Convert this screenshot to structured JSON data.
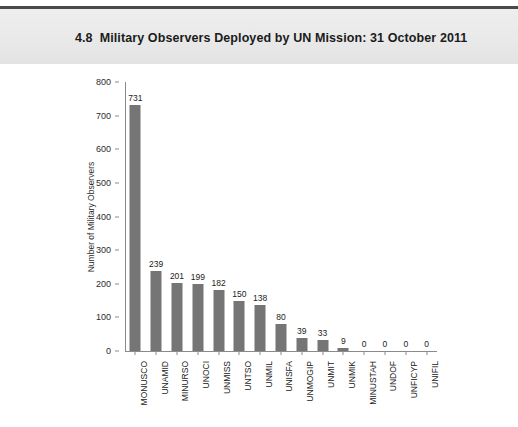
{
  "header": {
    "figure_number": "4.8",
    "title": "Military Observers Deployed by UN Mission: 31 October 2011"
  },
  "chart_data": {
    "type": "bar",
    "xlabel": "",
    "ylabel": "Number of Military Observers",
    "ylim": [
      0,
      800
    ],
    "yticks": [
      0,
      100,
      200,
      300,
      400,
      500,
      600,
      700,
      800
    ],
    "grid": false,
    "legend": null,
    "bar_color": "#757575",
    "categories": [
      "MONUSCO",
      "UNAMID",
      "MINURSO",
      "UNOCI",
      "UNMISS",
      "UNTSO",
      "UNMIL",
      "UNISFA",
      "UNMOGIP",
      "UNMIT",
      "UNMIK",
      "MINUSTAH",
      "UNDOF",
      "UNFICYP",
      "UNIFIL"
    ],
    "values": [
      731,
      239,
      201,
      199,
      182,
      150,
      138,
      80,
      39,
      33,
      9,
      0,
      0,
      0,
      0
    ],
    "value_labels": [
      "731",
      "239",
      "201",
      "199",
      "182",
      "150",
      "138",
      "80",
      "39",
      "33",
      "9",
      "0",
      "0",
      "0",
      "0"
    ]
  }
}
